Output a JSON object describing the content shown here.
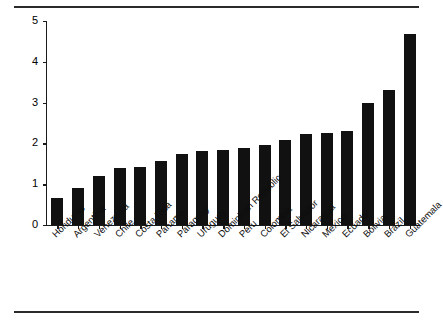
{
  "chart_data": {
    "type": "bar",
    "title": "",
    "xlabel": "",
    "ylabel": "Differential (Years of Schooling)",
    "ylim": [
      0,
      5
    ],
    "yticks": [
      0,
      1,
      2,
      3,
      4,
      5
    ],
    "ytick_labels": [
      "0",
      "1",
      "2",
      "3",
      "4",
      "5"
    ],
    "grid": false,
    "legend": null,
    "bar_color": "#111111",
    "categories": [
      "Honduras",
      "Argentina",
      "Venezuela",
      "Chile",
      "Costa Rica",
      "Panama",
      "Paraguay",
      "Uruguay",
      "Dominican Republic",
      "Peru",
      "Colombia",
      "El Salvador",
      "Nicaragua",
      "Mexico",
      "Ecuador",
      "Bolivia",
      "Brazil",
      "Guatemala"
    ],
    "values": [
      0.66,
      0.91,
      1.2,
      1.4,
      1.42,
      1.57,
      1.75,
      1.82,
      1.84,
      1.88,
      1.96,
      2.08,
      2.23,
      2.26,
      2.3,
      3.0,
      3.32,
      4.67
    ]
  },
  "figure": {
    "top_rule": "",
    "bottom_rule": ""
  }
}
